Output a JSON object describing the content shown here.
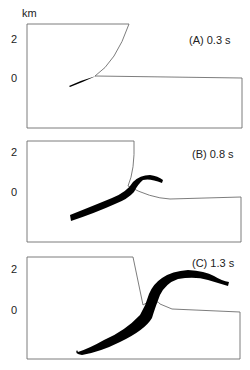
{
  "figure": {
    "unit_label": "km",
    "ink_color": "#000000",
    "outline_color": "#6e6e6e",
    "panels": [
      {
        "id": "A",
        "title": "(A) 0.3 s",
        "time_s": 0.3,
        "y_ticks": [
          {
            "label": "2",
            "y": 40
          },
          {
            "label": "0",
            "y": 79
          }
        ],
        "outline_points": "27,24 129,24 Q 115,62 95,76 L 95,77 242,78 242,128 27,128 27,24",
        "outline_path": "M27,24 L129,24 Q116,62 95,76 L242,78 L242,128 L27,128 Z",
        "flow_path": "M69,86 Q82,80 96,76 Q83,82 70,87 Z"
      },
      {
        "id": "B",
        "title": "(B) 0.8 s",
        "time_s": 0.8,
        "y_ticks": [
          {
            "label": "2",
            "y": 153
          },
          {
            "label": "0",
            "y": 193
          }
        ],
        "outline_path": "M27,141 L134,141 Q135,170 128,186 Q150,198 170,199 L241,197 L241,242 L27,242 Z",
        "flow_path": "M70,215 Q95,205 112,198 Q127,192 133,182 Q140,175 150,175 Q158,176 163,180 L162,183 Q150,178 143,180 Q138,184 134,192 Q128,199 115,204 Q95,213 71,221 Z"
      },
      {
        "id": "C",
        "title": "(C) 1.3 s",
        "time_s": 1.3,
        "y_ticks": [
          {
            "label": "2",
            "y": 270
          },
          {
            "label": "0",
            "y": 311
          }
        ],
        "outline_path": "M27,257 L133,257 L143,305 L148,302 Q158,300 160,304 L172,309 L240,312 L240,359 L27,359 Z",
        "flow_path": "M78,352 Q90,348 104,340 Q125,331 140,315 Q146,305 149,294 Q153,284 162,278 Q172,271 188,270 Q205,271 214,276 Q222,281 229,282 L228,286 Q218,283 208,280 Q195,276 178,279 Q166,283 160,295 Q155,308 152,318 Q145,330 120,342 Q100,352 82,355 Q74,354 77,350 Z"
      }
    ]
  }
}
